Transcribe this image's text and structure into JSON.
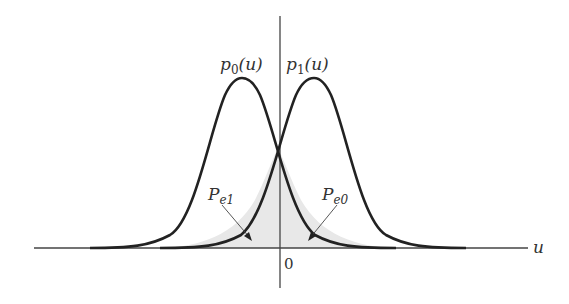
{
  "diagram": {
    "curves": [
      {
        "name": "p0",
        "label_main": "p",
        "label_sub": "0",
        "label_arg": "(u)",
        "mean_px": 242,
        "peak_y_px": 78
      },
      {
        "name": "p1",
        "label_main": "p",
        "label_sub": "1",
        "label_arg": "(u)",
        "mean_px": 314,
        "peak_y_px": 78
      }
    ],
    "regions": [
      {
        "name": "Pe1",
        "label_main": "P",
        "label_sub": "e1",
        "side": "left of 0, under p1"
      },
      {
        "name": "Pe0",
        "label_main": "P",
        "label_sub": "e0",
        "side": "right of 0, under p0"
      }
    ],
    "axes": {
      "x_label": "u",
      "origin_label": "0"
    },
    "colors": {
      "curve": "#222222",
      "axis": "#444444",
      "shade": "#e6e6e6"
    }
  }
}
